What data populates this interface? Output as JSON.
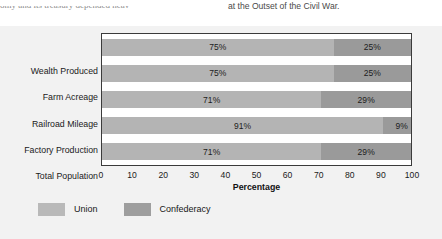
{
  "page_text": {
    "fragment_left": "omy and its treasury depended heav",
    "fragment_right": "at the Outset of the Civil War."
  },
  "chart_data": {
    "type": "bar",
    "orientation": "horizontal",
    "stacked": true,
    "title": "",
    "xlabel": "Percentage",
    "ylabel": "",
    "xlim": [
      0,
      100
    ],
    "xticks": [
      "0",
      "10",
      "20",
      "30",
      "40",
      "50",
      "60",
      "70",
      "80",
      "90",
      "100"
    ],
    "grid": false,
    "legend_position": "bottom-left",
    "categories": [
      "Wealth Produced",
      "Farm Acreage",
      "Railroad Mileage",
      "Factory Production",
      "Total Population"
    ],
    "series": [
      {
        "name": "Union",
        "color": "#b4b4b4",
        "values": [
          75,
          75,
          71,
          91,
          71
        ],
        "labels": [
          "75%",
          "75%",
          "71%",
          "91%",
          "71%"
        ]
      },
      {
        "name": "Confederacy",
        "color": "#9a9a9a",
        "values": [
          25,
          25,
          29,
          9,
          29
        ],
        "labels": [
          "25%",
          "25%",
          "29%",
          "9%",
          "29%"
        ]
      }
    ]
  },
  "legend": {
    "items": [
      {
        "label": "Union",
        "color": "#b9b9b9"
      },
      {
        "label": "Confederacy",
        "color": "#9e9e9e"
      }
    ]
  }
}
